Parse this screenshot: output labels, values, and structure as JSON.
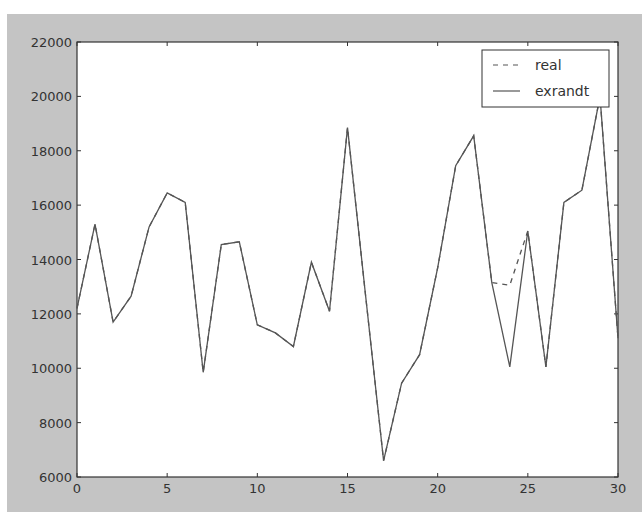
{
  "chart_data": {
    "type": "line",
    "title": "",
    "xlabel": "",
    "ylabel": "",
    "xlim": [
      0,
      30
    ],
    "ylim": [
      6000,
      22000
    ],
    "grid": false,
    "legend_position": "upper right",
    "x_ticks": [
      0,
      5,
      10,
      15,
      20,
      25,
      30
    ],
    "y_ticks": [
      6000,
      8000,
      10000,
      12000,
      14000,
      16000,
      18000,
      20000,
      22000
    ],
    "x": [
      0,
      1,
      2,
      3,
      4,
      5,
      6,
      7,
      8,
      9,
      10,
      11,
      12,
      13,
      14,
      15,
      16,
      17,
      18,
      19,
      20,
      21,
      22,
      23,
      24,
      25,
      26,
      27,
      28,
      29,
      30
    ],
    "series": [
      {
        "name": "real",
        "style": "dashed",
        "color": "#555555",
        "values": [
          12200,
          15300,
          11700,
          12650,
          15200,
          16450,
          16100,
          9850,
          14550,
          14650,
          11600,
          11300,
          10800,
          13900,
          12100,
          18850,
          12700,
          6600,
          9450,
          10500,
          13700,
          17450,
          18550,
          13150,
          13050,
          15050,
          10050,
          16100,
          16550,
          20000,
          11100
        ]
      },
      {
        "name": "exrandt",
        "style": "solid",
        "color": "#555555",
        "values": [
          12200,
          15300,
          11700,
          12650,
          15200,
          16450,
          16100,
          9850,
          14550,
          14650,
          11600,
          11300,
          10800,
          13900,
          12100,
          18850,
          12700,
          6600,
          9450,
          10500,
          13700,
          17450,
          18550,
          13150,
          10050,
          15050,
          10050,
          16100,
          16550,
          20000,
          11100
        ]
      }
    ]
  },
  "colors": {
    "figure_bg": "#c4c4c4",
    "plot_bg": "#ffffff",
    "axis": "#333333",
    "line": "#555555"
  }
}
